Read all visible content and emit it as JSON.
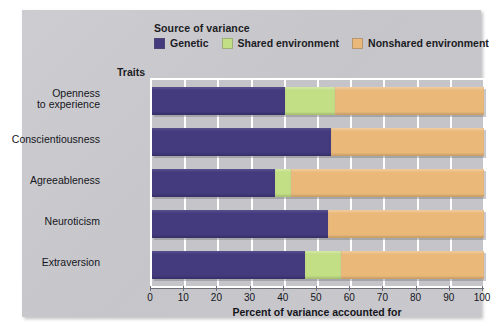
{
  "legend": {
    "title": "Source of variance",
    "items": [
      {
        "label": "Genetic",
        "color": "#433b7e",
        "key": "genetic"
      },
      {
        "label": "Shared environment",
        "color": "#c2df85",
        "key": "shared"
      },
      {
        "label": "Nonshared environment",
        "color": "#eab97a",
        "key": "nonshared"
      }
    ]
  },
  "axes": {
    "y_caption": "Traits",
    "x_title": "Percent of variance accounted for",
    "x_ticklabels": [
      "0",
      "10",
      "20",
      "30",
      "40",
      "50",
      "60",
      "70",
      "80",
      "90",
      "100"
    ]
  },
  "chart_data": {
    "type": "bar",
    "orientation": "horizontal",
    "stacked": true,
    "title": "",
    "subtitle": "",
    "xlabel": "Percent of variance accounted for",
    "ylabel": "Traits",
    "xlim": [
      0,
      100
    ],
    "xticks": [
      0,
      10,
      20,
      30,
      40,
      50,
      60,
      70,
      80,
      90,
      100
    ],
    "grid": true,
    "legend_title": "Source of variance",
    "legend_position": "top",
    "categories": [
      "Openness\nto experience",
      "Conscientiousness",
      "Agreeableness",
      "Neuroticism",
      "Extraversion"
    ],
    "series": [
      {
        "name": "Genetic",
        "color": "#433b7e",
        "values": [
          40,
          54,
          37,
          53,
          46
        ]
      },
      {
        "name": "Shared environment",
        "color": "#c2df85",
        "values": [
          15,
          0,
          5,
          0,
          11
        ]
      },
      {
        "name": "Nonshared environment",
        "color": "#eab97a",
        "values": [
          45,
          46,
          58,
          47,
          43
        ]
      }
    ]
  },
  "rows": [
    {
      "label_line1": "Openness",
      "label_line2": "to experience",
      "genetic": 40,
      "shared": 15,
      "nonshared": 45
    },
    {
      "label_line1": "Conscientiousness",
      "label_line2": "",
      "genetic": 54,
      "shared": 0,
      "nonshared": 46
    },
    {
      "label_line1": "Agreeableness",
      "label_line2": "",
      "genetic": 37,
      "shared": 5,
      "nonshared": 58
    },
    {
      "label_line1": "Neuroticism",
      "label_line2": "",
      "genetic": 53,
      "shared": 0,
      "nonshared": 47
    },
    {
      "label_line1": "Extraversion",
      "label_line2": "",
      "genetic": 46,
      "shared": 11,
      "nonshared": 43
    }
  ]
}
